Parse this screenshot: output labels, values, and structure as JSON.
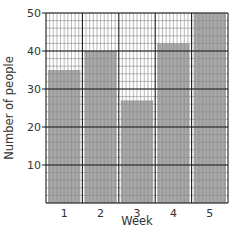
{
  "chart_data": {
    "type": "bar",
    "title": "",
    "xlabel": "Week",
    "ylabel": "Number of people",
    "categories": [
      "1",
      "2",
      "3",
      "4",
      "5"
    ],
    "values": [
      35,
      40,
      27,
      42,
      50
    ],
    "ylim": [
      0,
      50
    ],
    "yticks": [
      10,
      20,
      30,
      40,
      50
    ],
    "grid": true,
    "legend": null,
    "colors": {
      "bar": "#a8a8a8",
      "grid_minor": "#8a8a8a",
      "grid_major": "#1a1a1a",
      "background": "#ffffff"
    }
  }
}
